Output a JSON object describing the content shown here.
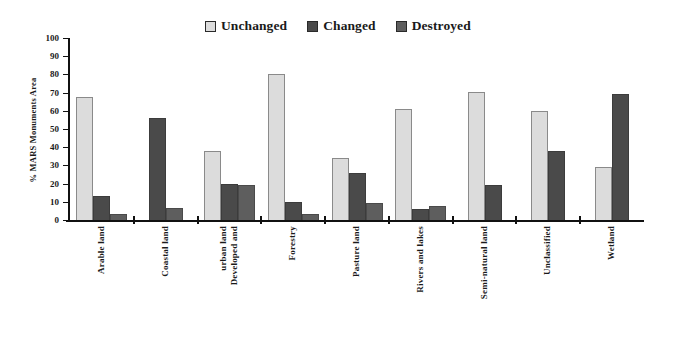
{
  "chart_data": {
    "type": "bar",
    "title": "",
    "xlabel": "",
    "ylabel": "% MARS Monuments Area",
    "ylim": [
      0,
      100
    ],
    "ytick_step": 10,
    "yticks": [
      100,
      90,
      80,
      70,
      60,
      50,
      40,
      30,
      20,
      10,
      0
    ],
    "grid": false,
    "legend_position": "top-center",
    "categories": [
      "Arable land",
      "Coastal land",
      "Developed and urban land",
      "Forestry",
      "Pasture land",
      "Rivers and lakes",
      "Semi-natural land",
      "Unclassified",
      "Wetland"
    ],
    "category_lines": [
      [
        "Arable land"
      ],
      [
        "Coastal land"
      ],
      [
        "Developed and",
        "urban land"
      ],
      [
        "Forestry"
      ],
      [
        "Pasture land"
      ],
      [
        "Rivers and lakes"
      ],
      [
        "Semi-natural land"
      ],
      [
        "Unclassified"
      ],
      [
        "Wetland"
      ]
    ],
    "series": [
      {
        "name": "Unchanged",
        "color": "#dcdcdc",
        "values": [
          67.5,
          0,
          38,
          80.5,
          34,
          61,
          70.5,
          60,
          29
        ]
      },
      {
        "name": "Changed",
        "color": "#4a4a4a",
        "values": [
          13,
          56,
          20,
          10,
          26,
          6,
          19.5,
          38,
          69.5
        ]
      },
      {
        "name": "Destroyed",
        "color": "#5e5e5e",
        "values": [
          3.5,
          6.5,
          19.5,
          3.5,
          9.5,
          7.5,
          0,
          0,
          0
        ]
      }
    ]
  },
  "legend": {
    "entries": [
      {
        "label": "Unchanged",
        "color": "#dcdcdc"
      },
      {
        "label": "Changed",
        "color": "#4a4a4a"
      },
      {
        "label": "Destroyed",
        "color": "#5e5e5e"
      }
    ]
  },
  "axis": {
    "y_title": "% MARS Monuments Area"
  }
}
